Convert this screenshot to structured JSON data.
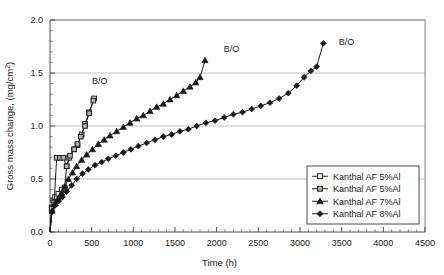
{
  "chart_data": {
    "type": "line",
    "title": "",
    "xlabel": "Time (h)",
    "ylabel": "Gross mass change, (mg/cm2)",
    "ylabel_display": "Gross mass change, (mg/cm",
    "ylabel_sup": "2",
    "ylabel_tail": ")",
    "xlim": [
      0,
      4500
    ],
    "ylim": [
      0.0,
      2.0
    ],
    "xticks": [
      0,
      500,
      1000,
      1500,
      2000,
      2500,
      3000,
      3500,
      4000,
      4500
    ],
    "xticklabels": [
      "0",
      "500",
      "1000",
      "1500",
      "2000",
      "2500",
      "3000",
      "3500",
      "4000",
      "4500"
    ],
    "yticks": [
      0.0,
      0.5,
      1.0,
      1.5,
      2.0
    ],
    "yticklabels": [
      "0.0",
      "0.5",
      "1.0",
      "1.5",
      "2.0"
    ],
    "x_minor_interval": 100,
    "y_minor_interval": 0.1,
    "grid": "horizontal",
    "legend_position": "lower-right",
    "annotations": [
      {
        "text": "B/O",
        "x": 420,
        "y": 1.43,
        "series": "Kanthal AF 5%Al (open square)"
      },
      {
        "text": "B/O",
        "x": 2000,
        "y": 1.73,
        "series": "Kanthal AF 7%Al"
      },
      {
        "text": "B/O",
        "x": 3380,
        "y": 1.8,
        "series": "Kanthal AF 8%Al"
      }
    ],
    "series": [
      {
        "name": "Kanthal AF 5%Al",
        "marker": "open-square",
        "marker_fill": "#ffffff",
        "marker_stroke": "#1a1a1a",
        "points": [
          [
            0,
            0.0
          ],
          [
            20,
            0.23
          ],
          [
            40,
            0.3
          ],
          [
            60,
            0.33
          ],
          [
            100,
            0.36
          ],
          [
            140,
            0.4
          ],
          [
            175,
            0.42
          ],
          [
            200,
            0.62
          ],
          [
            230,
            0.7
          ],
          [
            290,
            0.78
          ],
          [
            330,
            0.82
          ],
          [
            380,
            0.92
          ],
          [
            420,
            1.02
          ],
          [
            470,
            1.13
          ],
          [
            530,
            1.26
          ]
        ]
      },
      {
        "name": "Kanthal AF 5%Al",
        "marker": "gray-square",
        "marker_fill": "#b3b3b3",
        "marker_stroke": "#1a1a1a",
        "points": [
          [
            0,
            0.0
          ],
          [
            20,
            0.22
          ],
          [
            50,
            0.28
          ],
          [
            80,
            0.7
          ],
          [
            120,
            0.7
          ],
          [
            160,
            0.7
          ],
          [
            200,
            0.62
          ],
          [
            240,
            0.72
          ],
          [
            290,
            0.78
          ],
          [
            330,
            0.83
          ],
          [
            370,
            0.9
          ],
          [
            420,
            1.0
          ],
          [
            470,
            1.12
          ],
          [
            520,
            1.24
          ]
        ]
      },
      {
        "name": "Kanthal AF 7%Al",
        "marker": "filled-triangle",
        "marker_fill": "#1a1a1a",
        "marker_stroke": "#1a1a1a",
        "points": [
          [
            0,
            0.0
          ],
          [
            25,
            0.2
          ],
          [
            60,
            0.27
          ],
          [
            100,
            0.32
          ],
          [
            140,
            0.37
          ],
          [
            180,
            0.43
          ],
          [
            220,
            0.5
          ],
          [
            270,
            0.56
          ],
          [
            320,
            0.62
          ],
          [
            380,
            0.68
          ],
          [
            440,
            0.73
          ],
          [
            510,
            0.78
          ],
          [
            580,
            0.83
          ],
          [
            650,
            0.87
          ],
          [
            720,
            0.91
          ],
          [
            800,
            0.95
          ],
          [
            880,
            0.99
          ],
          [
            960,
            1.03
          ],
          [
            1040,
            1.07
          ],
          [
            1120,
            1.1
          ],
          [
            1200,
            1.14
          ],
          [
            1280,
            1.18
          ],
          [
            1360,
            1.21
          ],
          [
            1440,
            1.25
          ],
          [
            1520,
            1.29
          ],
          [
            1600,
            1.33
          ],
          [
            1680,
            1.37
          ],
          [
            1750,
            1.41
          ],
          [
            1800,
            1.46
          ],
          [
            1860,
            1.62
          ]
        ]
      },
      {
        "name": "Kanthal AF 8%Al",
        "marker": "filled-diamond",
        "marker_fill": "#1a1a1a",
        "marker_stroke": "#1a1a1a",
        "points": [
          [
            0,
            0.0
          ],
          [
            25,
            0.19
          ],
          [
            60,
            0.25
          ],
          [
            100,
            0.29
          ],
          [
            150,
            0.33
          ],
          [
            200,
            0.38
          ],
          [
            260,
            0.44
          ],
          [
            320,
            0.5
          ],
          [
            390,
            0.55
          ],
          [
            460,
            0.59
          ],
          [
            540,
            0.63
          ],
          [
            620,
            0.66
          ],
          [
            700,
            0.69
          ],
          [
            790,
            0.72
          ],
          [
            880,
            0.75
          ],
          [
            970,
            0.78
          ],
          [
            1060,
            0.81
          ],
          [
            1160,
            0.84
          ],
          [
            1260,
            0.87
          ],
          [
            1360,
            0.9
          ],
          [
            1460,
            0.92
          ],
          [
            1560,
            0.95
          ],
          [
            1660,
            0.97
          ],
          [
            1760,
            1.0
          ],
          [
            1870,
            1.03
          ],
          [
            1980,
            1.05
          ],
          [
            2090,
            1.08
          ],
          [
            2200,
            1.11
          ],
          [
            2310,
            1.13
          ],
          [
            2420,
            1.16
          ],
          [
            2530,
            1.19
          ],
          [
            2640,
            1.22
          ],
          [
            2750,
            1.26
          ],
          [
            2860,
            1.31
          ],
          [
            2960,
            1.38
          ],
          [
            3050,
            1.46
          ],
          [
            3130,
            1.52
          ],
          [
            3200,
            1.56
          ],
          [
            3280,
            1.78
          ]
        ]
      }
    ]
  },
  "legend": {
    "entries": [
      {
        "label": "Kanthal AF 5%Al",
        "marker": "open-square"
      },
      {
        "label": "Kanthal AF 5%Al",
        "marker": "gray-square"
      },
      {
        "label": "Kanthal AF 7%Al",
        "marker": "filled-triangle"
      },
      {
        "label": "Kanthal AF 8%Al",
        "marker": "filled-diamond"
      }
    ]
  }
}
